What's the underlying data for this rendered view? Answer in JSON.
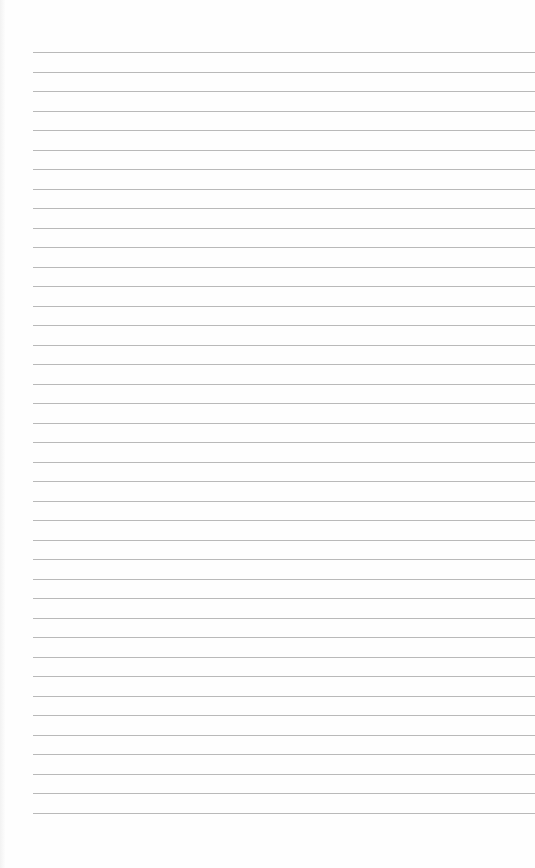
{
  "page": {
    "type": "lined-paper",
    "background_color": "#fefefe",
    "line_color": "#b9b9b9",
    "line_count": 40,
    "first_line_y": 52,
    "line_spacing": 19.5,
    "line_left": 33
  }
}
